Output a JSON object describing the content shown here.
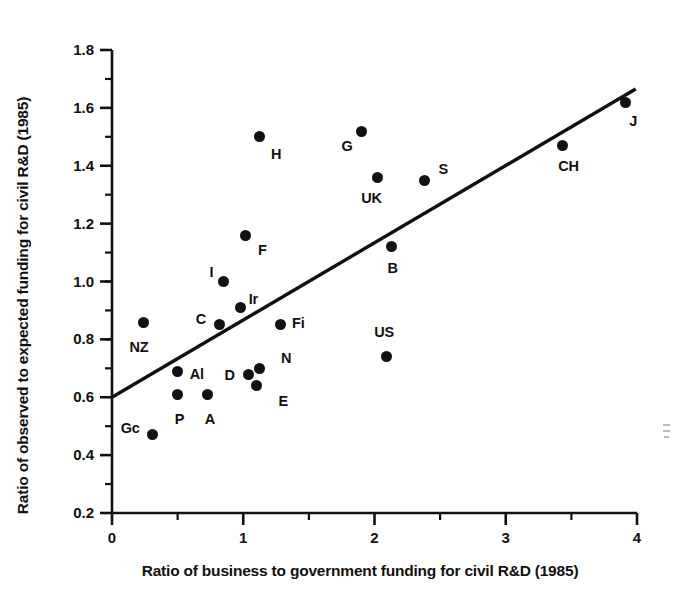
{
  "chart_data": {
    "type": "scatter",
    "title": "",
    "xlabel": "Ratio of business to government funding for civil R&D (1985)",
    "ylabel": "Ratio of observed to expected funding for civil R&D (1985)",
    "xlim": [
      0,
      4
    ],
    "ylim": [
      0.2,
      1.8
    ],
    "xticks": [
      0,
      1,
      2,
      3,
      4
    ],
    "xtick_labels": [
      "0",
      "1",
      "2",
      "3",
      "4"
    ],
    "xminor_step": 0.5,
    "yticks": [
      0.2,
      0.4,
      0.6,
      0.8,
      1.0,
      1.2,
      1.4,
      1.6,
      1.8
    ],
    "ytick_labels": [
      "0.2",
      "0.4",
      "0.6",
      "0.8",
      "1.0",
      "1.2",
      "1.4",
      "1.6",
      "1.8"
    ],
    "yminor_step": 0.1,
    "grid": false,
    "legend": false,
    "marker": "filled-circle",
    "marker_color": "#111111",
    "points": [
      {
        "label": "NZ",
        "x": 0.24,
        "y": 0.86,
        "lx": -14,
        "ly": 26
      },
      {
        "label": "Gc",
        "x": 0.31,
        "y": 0.47,
        "lx": -32,
        "ly": -6
      },
      {
        "label": "P",
        "x": 0.5,
        "y": 0.61,
        "lx": -3,
        "ly": 26
      },
      {
        "label": "Al",
        "x": 0.5,
        "y": 0.69,
        "lx": 12,
        "ly": 4
      },
      {
        "label": "A",
        "x": 0.73,
        "y": 0.61,
        "lx": -3,
        "ly": 26
      },
      {
        "label": "C",
        "x": 0.82,
        "y": 0.85,
        "lx": -24,
        "ly": -5
      },
      {
        "label": "I",
        "x": 0.85,
        "y": 1.0,
        "lx": -14,
        "ly": -9
      },
      {
        "label": "Ir",
        "x": 0.98,
        "y": 0.91,
        "lx": 8,
        "ly": -8
      },
      {
        "label": "F",
        "x": 1.02,
        "y": 1.16,
        "lx": 12,
        "ly": 16
      },
      {
        "label": "D",
        "x": 1.04,
        "y": 0.68,
        "lx": -24,
        "ly": 2
      },
      {
        "label": "N",
        "x": 1.12,
        "y": 0.7,
        "lx": 22,
        "ly": -9
      },
      {
        "label": "E",
        "x": 1.1,
        "y": 0.64,
        "lx": 22,
        "ly": 16
      },
      {
        "label": "H",
        "x": 1.12,
        "y": 1.5,
        "lx": 12,
        "ly": 18
      },
      {
        "label": "Fi",
        "x": 1.28,
        "y": 0.85,
        "lx": 12,
        "ly": -1
      },
      {
        "label": "G",
        "x": 1.9,
        "y": 1.52,
        "lx": -20,
        "ly": 16
      },
      {
        "label": "UK",
        "x": 2.02,
        "y": 1.36,
        "lx": -16,
        "ly": 22
      },
      {
        "label": "US",
        "x": 2.09,
        "y": 0.74,
        "lx": -12,
        "ly": -24
      },
      {
        "label": "B",
        "x": 2.13,
        "y": 1.12,
        "lx": -4,
        "ly": 22
      },
      {
        "label": "S",
        "x": 2.38,
        "y": 1.35,
        "lx": 14,
        "ly": -10
      },
      {
        "label": "CH",
        "x": 3.43,
        "y": 1.47,
        "lx": -4,
        "ly": 22
      },
      {
        "label": "J",
        "x": 3.91,
        "y": 1.62,
        "lx": 4,
        "ly": 20
      }
    ],
    "trendline": {
      "name": "regression-line",
      "x0": 0.0,
      "y0": 0.6,
      "x1": 3.99,
      "y1": 1.665,
      "color": "#111111",
      "width": 3.4
    }
  }
}
